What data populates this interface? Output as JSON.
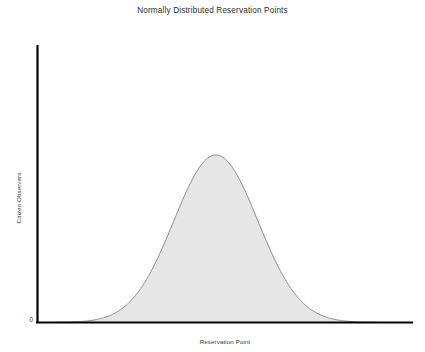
{
  "chart_data": {
    "type": "area",
    "title": "Normally Distributed Reservation Points",
    "xlabel": "Reservation Point",
    "ylabel": "Citizen Observers",
    "grid": false,
    "legend": null,
    "xtick_labels": [],
    "ytick_labels": [
      "0"
    ],
    "xlim": [
      0,
      100
    ],
    "ylim": [
      0,
      1.05
    ],
    "axis_color": "#000000",
    "fill_color": "#e6e6e6",
    "line_color": "#8a8a8a",
    "distribution": {
      "kind": "gaussian",
      "mean": 47.5,
      "sigma": 11.2,
      "peak_value": 1.0
    },
    "x": [
      0,
      2.5,
      5,
      7.5,
      10,
      12.5,
      15,
      17.5,
      20,
      22.5,
      25,
      27.5,
      30,
      32.5,
      35,
      37.5,
      40,
      42.5,
      45,
      47.5,
      50,
      52.5,
      55,
      57.5,
      60,
      62.5,
      65,
      67.5,
      70,
      72.5,
      75,
      77.5,
      80,
      82.5,
      85,
      87.5,
      90,
      92.5,
      95,
      97.5,
      100
    ],
    "y": [
      0.001,
      0.002,
      0.004,
      0.008,
      0.015,
      0.027,
      0.046,
      0.075,
      0.117,
      0.174,
      0.248,
      0.339,
      0.444,
      0.558,
      0.672,
      0.777,
      0.864,
      0.929,
      0.972,
      1.0,
      0.994,
      0.961,
      0.907,
      0.82,
      0.72,
      0.612,
      0.5,
      0.394,
      0.299,
      0.218,
      0.153,
      0.103,
      0.066,
      0.041,
      0.024,
      0.014,
      0.008,
      0.004,
      0.002,
      0.001,
      0.0
    ]
  }
}
